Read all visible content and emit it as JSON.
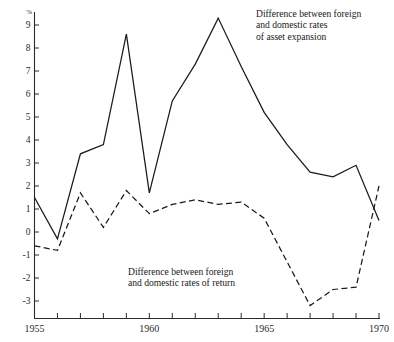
{
  "chart_data": {
    "type": "line",
    "title": "",
    "xlabel": "",
    "ylabel": "",
    "y_unit": "%",
    "xlim": [
      1955,
      1970
    ],
    "ylim": [
      -3.6,
      9.6
    ],
    "grid": false,
    "legend_position": "inline-annotations",
    "y_ticks": [
      9,
      8,
      7,
      6,
      5,
      4,
      3,
      2,
      1,
      0,
      -1,
      -2,
      -3
    ],
    "y_tick_labels": [
      "9",
      "8",
      "7",
      "6",
      "5",
      "4",
      "3",
      "2",
      "1",
      "0",
      "-1",
      "-2",
      "-3"
    ],
    "x_ticks": [
      1955,
      1956,
      1957,
      1958,
      1959,
      1960,
      1961,
      1962,
      1963,
      1964,
      1965,
      1966,
      1967,
      1968,
      1969,
      1970
    ],
    "x_tick_labels": [
      "1955",
      "",
      "",
      "",
      "",
      "1960",
      "",
      "",
      "",
      "",
      "1965",
      "",
      "",
      "",
      "",
      "1970"
    ],
    "x": [
      1955,
      1956,
      1957,
      1958,
      1959,
      1960,
      1961,
      1962,
      1963,
      1964,
      1965,
      1966,
      1967,
      1968,
      1969,
      1970
    ],
    "series": [
      {
        "name": "Difference between foreign and domestic rates of asset expansion",
        "style": "solid",
        "values": [
          1.5,
          -0.3,
          3.4,
          3.8,
          8.6,
          1.7,
          5.7,
          7.3,
          9.3,
          7.2,
          5.2,
          3.8,
          2.6,
          2.4,
          2.9,
          0.5
        ]
      },
      {
        "name": "Difference between foreign and domestic rates of return",
        "style": "dashed",
        "values": [
          -0.6,
          -0.8,
          1.7,
          0.2,
          1.8,
          0.8,
          1.2,
          1.4,
          1.2,
          1.3,
          0.6,
          -1.3,
          -3.2,
          -2.5,
          -2.4,
          2.0
        ]
      }
    ],
    "annotations": [
      {
        "id": "asset-expansion",
        "lines": [
          "Difference between foreign",
          "and domestic rates",
          "of asset expansion"
        ],
        "target_series": "Difference between foreign and domestic rates of asset expansion"
      },
      {
        "id": "rates-return",
        "lines": [
          "Difference between foreign",
          "and domestic rates of return"
        ],
        "target_series": "Difference between foreign and domestic rates of return"
      }
    ],
    "colors": {
      "line": "#1a1a1a",
      "axis": "#2b2b2b",
      "background": "#ffffff"
    }
  }
}
